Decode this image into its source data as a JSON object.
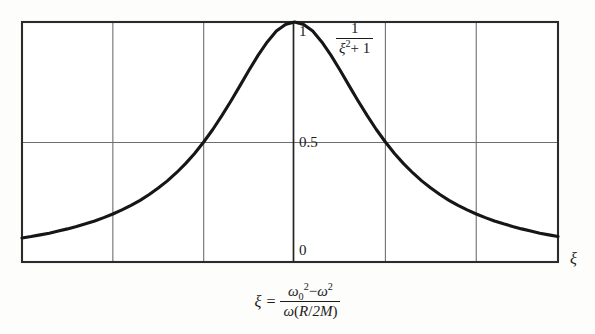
{
  "chart_data": {
    "type": "line",
    "title": "",
    "subtitle": "",
    "xlabel": "ξ",
    "ylabel": "",
    "xlim": [
      -3.0,
      2.9
    ],
    "ylim": [
      0.0,
      1.0
    ],
    "grid": true,
    "legend_position": "inside-upper-right",
    "annotation_label": "1/(ξ²+1)",
    "y_tick_labels": [
      "1",
      "0.5",
      "0"
    ],
    "y_tick_values": [
      1.0,
      0.5,
      0.0
    ],
    "x_gridline_values": [
      -3,
      -2,
      -1,
      0,
      1,
      2,
      3
    ],
    "x_tick_labels": [],
    "series": [
      {
        "name": "1/(ξ²+1)",
        "x": [
          -3.0,
          -2.9,
          -2.8,
          -2.7,
          -2.6,
          -2.5,
          -2.4,
          -2.3,
          -2.2,
          -2.1,
          -2.0,
          -1.9,
          -1.8,
          -1.7,
          -1.6,
          -1.5,
          -1.4,
          -1.3,
          -1.2,
          -1.1,
          -1.0,
          -0.9,
          -0.8,
          -0.7,
          -0.6,
          -0.5,
          -0.4,
          -0.3,
          -0.2,
          -0.1,
          0.0,
          0.1,
          0.2,
          0.3,
          0.4,
          0.5,
          0.6,
          0.7,
          0.8,
          0.9,
          1.0,
          1.1,
          1.2,
          1.3,
          1.4,
          1.5,
          1.6,
          1.7,
          1.8,
          1.9,
          2.0,
          2.1,
          2.2,
          2.3,
          2.4,
          2.5,
          2.6,
          2.7,
          2.8,
          2.9
        ],
        "y": [
          0.1,
          0.106,
          0.113,
          0.12,
          0.129,
          0.138,
          0.148,
          0.159,
          0.171,
          0.185,
          0.2,
          0.217,
          0.236,
          0.257,
          0.281,
          0.308,
          0.338,
          0.372,
          0.41,
          0.452,
          0.5,
          0.552,
          0.61,
          0.671,
          0.735,
          0.8,
          0.862,
          0.917,
          0.962,
          0.99,
          1.0,
          0.99,
          0.962,
          0.917,
          0.862,
          0.8,
          0.735,
          0.671,
          0.61,
          0.552,
          0.5,
          0.452,
          0.41,
          0.372,
          0.338,
          0.308,
          0.281,
          0.257,
          0.236,
          0.217,
          0.2,
          0.185,
          0.171,
          0.159,
          0.148,
          0.138,
          0.129,
          0.12,
          0.113,
          0.106
        ]
      }
    ],
    "colors": {
      "curve": "#161616",
      "frame": "#2b2b2b",
      "gridline": "#6e6e6e",
      "background": "#fdfdfc",
      "text": "#1b1b1b"
    }
  },
  "plot": {
    "annotation": {
      "numerator": "1",
      "denominator_var": "ξ",
      "denominator_exp": "2",
      "denominator_tail": "+ 1"
    },
    "y_ticks": {
      "one": "1",
      "half": "0.5",
      "zero": "0"
    },
    "x_axis_name": "ξ"
  },
  "caption": {
    "lhs": "ξ",
    "equals": "=",
    "numerator": {
      "omega": "ω",
      "omega_sub": "0",
      "omega_sup": "2",
      "minus": "−",
      "omega2": "ω",
      "omega2_sup": "2"
    },
    "denominator": {
      "omega": "ω",
      "open": "(",
      "r": "R",
      "slash": "/",
      "two_m": "2M",
      "close": ")"
    },
    "plain_text": "ξ = (ω₀² − ω²) / (ω(R/2M))"
  }
}
